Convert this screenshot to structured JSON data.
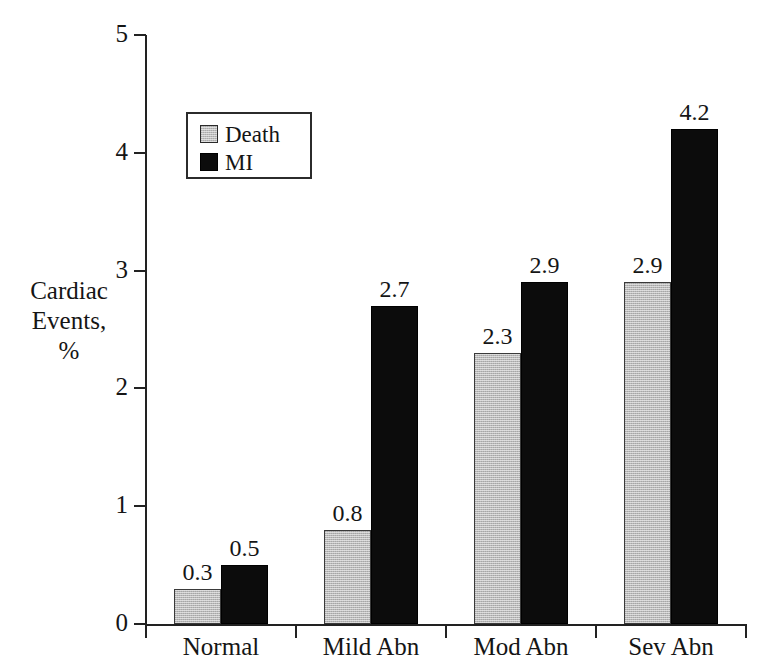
{
  "chart_data": {
    "type": "bar",
    "title": "",
    "subtitle": "",
    "xlabel": "",
    "ylabel": "Cardiac Events, %",
    "ylabel_lines": [
      "Cardiac",
      "Events,",
      "%"
    ],
    "categories": [
      "Normal",
      "Mild Abn",
      "Mod Abn",
      "Sev Abn"
    ],
    "series": [
      {
        "name": "Death",
        "color": "#b9b9b9",
        "values": [
          0.3,
          0.8,
          2.3,
          2.9
        ]
      },
      {
        "name": "MI",
        "color": "#0c0c0c",
        "values": [
          0.5,
          2.7,
          2.9,
          4.2
        ]
      }
    ],
    "value_labels": {
      "Death": [
        "0.3",
        "0.8",
        "2.3",
        "2.9"
      ],
      "MI": [
        "0.5",
        "2.7",
        "2.9",
        "4.2"
      ]
    },
    "ylim": [
      0,
      5
    ],
    "y_ticks": [
      0,
      1,
      2,
      3,
      4,
      5
    ],
    "y_tick_labels": [
      "0",
      "1",
      "2",
      "3",
      "4",
      "5"
    ],
    "grid": false,
    "legend": {
      "position": "upper-left-inside",
      "boxed": true,
      "entries": [
        {
          "label": "Death",
          "color": "#b9b9b9",
          "swatch": "gray-square-icon"
        },
        {
          "label": "MI",
          "color": "#0c0c0c",
          "swatch": "black-square-icon"
        }
      ]
    },
    "axis_color": "#222222",
    "background": "#ffffff"
  }
}
